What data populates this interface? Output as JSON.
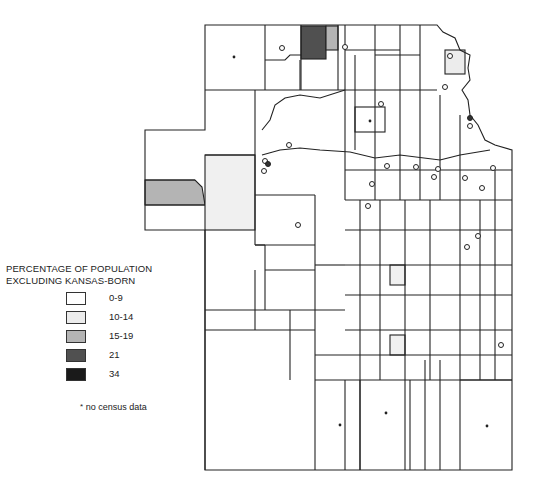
{
  "legend": {
    "title_line1": "PERCENTAGE OF POPULATION",
    "title_line2": "EXCLUDING KANSAS-BORN",
    "items": [
      {
        "label": "0-9",
        "color": "#ffffff"
      },
      {
        "label": "10-14",
        "color": "#ececec"
      },
      {
        "label": "15-19",
        "color": "#b4b4b4"
      },
      {
        "label": "21",
        "color": "#505050"
      },
      {
        "label": "34",
        "color": "#1a1a1a"
      }
    ],
    "note_marker": "*",
    "note_text": "no census data"
  },
  "map": {
    "subject": "Kansas counties",
    "shaded_regions": [
      {
        "area": "north-central county",
        "class": "21"
      },
      {
        "area": "county east of dark county",
        "class": "15-19"
      },
      {
        "area": "northeast county",
        "class": "10-14"
      },
      {
        "area": "west panhandle strip",
        "class": "15-19"
      },
      {
        "area": "west-central county",
        "class": "10-14"
      },
      {
        "area": "central county",
        "class": "10-14"
      },
      {
        "area": "south-central county",
        "class": "10-14"
      }
    ]
  }
}
